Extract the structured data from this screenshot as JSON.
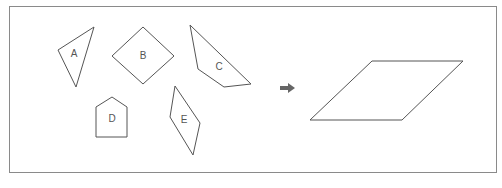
{
  "diagram": {
    "frame": {
      "x": 9,
      "y": 6,
      "width": 488,
      "height": 167,
      "stroke": "#8a8a8a"
    },
    "stroke_color": "#555555",
    "arrow_color": "#666666",
    "pieces": [
      {
        "label": "A",
        "points": "58,50 94,27 76,87",
        "label_x": 74,
        "label_y": 54
      },
      {
        "label": "B",
        "points": "112,56 143,27 174,56 143,84",
        "label_x": 143,
        "label_y": 56
      },
      {
        "label": "C",
        "points": "190,25 198,69 224,87 251,84",
        "label_x": 219,
        "label_y": 67
      },
      {
        "label": "D",
        "points": "96,107 112,97 127,107 127,137 96,137",
        "label_x": 112,
        "label_y": 119
      },
      {
        "label": "E",
        "points": "175,86 170,117 193,155 200,123",
        "label_x": 184,
        "label_y": 120
      }
    ],
    "arrow": {
      "symbol": "right-arrow",
      "x": 280,
      "y": 88
    },
    "target_shape": {
      "name": "parallelogram",
      "points": "310,120 372,61 463,61 402,120"
    }
  }
}
